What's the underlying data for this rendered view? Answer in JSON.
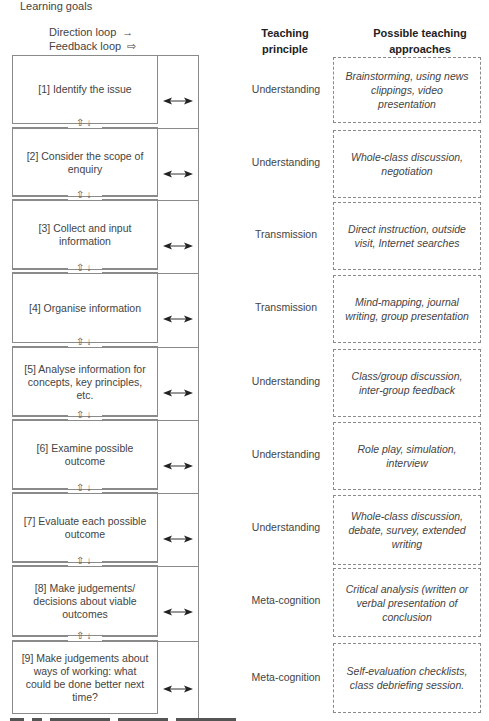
{
  "title": "Learning goals",
  "legend": {
    "direction": {
      "label": "Direction loop",
      "glyph": "→"
    },
    "feedback": {
      "label": "Feedback loop",
      "glyph": "⇨"
    }
  },
  "headers": {
    "principle": "Teaching principle",
    "approaches": "Possible teaching approaches"
  },
  "connector_glyphs": "⇧↓",
  "arrow_icon": "double-headed-arrow",
  "rows": [
    {
      "step": "[1] Identify the issue",
      "principle": "Understanding",
      "approach": "Brainstorming, using news clippings, video presentation"
    },
    {
      "step": "[2] Consider the scope of enquiry",
      "principle": "Understanding",
      "approach": "Whole-class discussion, negotiation"
    },
    {
      "step": "[3] Collect and input information",
      "principle": "Transmission",
      "approach": "Direct instruction, outside visit, Internet searches"
    },
    {
      "step": "[4] Organise information",
      "principle": "Transmission",
      "approach": "Mind-mapping, journal writing, group presentation"
    },
    {
      "step": "[5] Analyse information for concepts, key principles, etc.",
      "principle": "Understanding",
      "approach": "Class/group discussion, inter-group feedback"
    },
    {
      "step": "[6] Examine possible outcome",
      "principle": "Understanding",
      "approach": "Role play, simulation, interview"
    },
    {
      "step": "[7] Evaluate each possible outcome",
      "principle": "Understanding",
      "approach": "Whole-class discussion, debate, survey, extended writing"
    },
    {
      "step": "[8] Make judgements/ decisions about viable outcomes",
      "principle": "Meta-cognition",
      "approach": "Critical analysis (written or verbal presentation of conclusion"
    },
    {
      "step": "[9] Make judgements about ways of working: what could be done better next time?",
      "principle": "Meta-cognition",
      "approach": "Self-evaluation checklists, class debriefing session."
    }
  ]
}
